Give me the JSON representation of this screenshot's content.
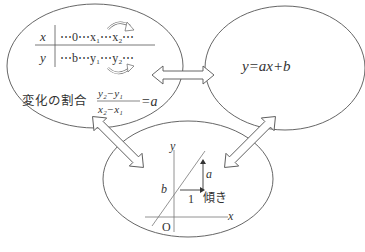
{
  "diagram": {
    "type": "concept-relationship",
    "nodes": {
      "table": {
        "row_x": {
          "label": "x",
          "cells": "⋯0⋯x₁⋯x₂⋯"
        },
        "row_y": {
          "label": "y",
          "cells": "⋯b⋯y₁⋯y₂⋯"
        },
        "rate_label": "変化の割合",
        "rate_numerator": "y₂−y₁",
        "rate_denominator": "x₂−x₁",
        "rate_result": "=a"
      },
      "equation": {
        "text": "y=ax+b"
      },
      "graph": {
        "axis_x": "x",
        "axis_y": "y",
        "origin": "O",
        "intercept": "b",
        "run": "1",
        "rise": "a",
        "slope_label": "傾き"
      }
    },
    "connections": [
      {
        "from": "table",
        "to": "equation",
        "style": "double-arrow"
      },
      {
        "from": "table",
        "to": "graph",
        "style": "double-arrow"
      },
      {
        "from": "equation",
        "to": "graph",
        "style": "double-arrow"
      }
    ],
    "colors": {
      "stroke": "#555555",
      "text": "#333333",
      "background": "#ffffff"
    }
  }
}
